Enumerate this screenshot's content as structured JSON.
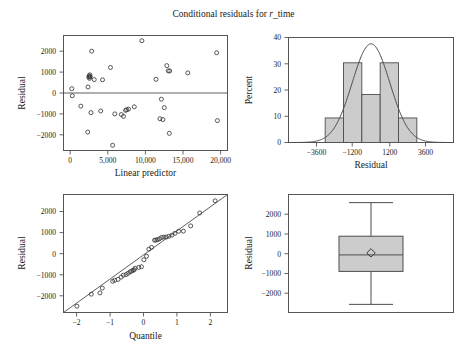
{
  "figure": {
    "title_prefix": "Conditional residuals for ",
    "title_italic": "r",
    "title_suffix": "_time",
    "title_full": "Conditional residuals for r_time",
    "width": 467,
    "height": 357,
    "background": "#ffffff",
    "marker_color": "#3a3a3a",
    "bar_fill": "#cccccc",
    "line_color": "#4d4d4d"
  },
  "chart_data": [
    {
      "type": "scatter",
      "panel": "top-left",
      "title": "",
      "xlabel": "Linear predictor",
      "ylabel": "Residual",
      "xlim": [
        -900,
        21800
      ],
      "ylim": [
        -2750,
        2750
      ],
      "xticks": [
        0,
        5000,
        10000,
        15000,
        20000
      ],
      "xticklabels": [
        "0",
        "5,000",
        "10,000",
        "15,000",
        "20,000"
      ],
      "yticks": [
        -2000,
        -1000,
        0,
        1000,
        2000
      ],
      "yticklabels": [
        "−2000",
        "−1000",
        "0",
        "1000",
        "2000"
      ],
      "grid": false,
      "reference_line": {
        "type": "horizontal",
        "y": 0
      },
      "x": [
        250,
        320,
        1500,
        2450,
        2500,
        2600,
        2650,
        2700,
        2720,
        2750,
        2800,
        2900,
        3000,
        3350,
        4250,
        4500,
        5600,
        5900,
        6200,
        7100,
        7400,
        7700,
        7850,
        8100,
        8900,
        9950,
        11900,
        12450,
        12650,
        12850,
        13050,
        13400,
        13600,
        13750,
        13800,
        16300,
        20300,
        20400
      ],
      "y": [
        205,
        -130,
        -630,
        -1870,
        290,
        760,
        820,
        700,
        780,
        870,
        780,
        -940,
        2000,
        640,
        -860,
        630,
        1220,
        -2500,
        -1000,
        -1030,
        -1120,
        -830,
        -800,
        -770,
        -660,
        2500,
        655,
        -1230,
        -295,
        -1270,
        -700,
        1310,
        1060,
        -1930,
        1055,
        960,
        1925,
        -1320
      ]
    },
    {
      "type": "bar",
      "panel": "top-right",
      "title": "",
      "xlabel": "Residual",
      "ylabel": "Percent",
      "xlim": [
        -5400,
        5400
      ],
      "ylim": [
        0,
        41.5
      ],
      "xticks": [
        -3600,
        -1200,
        1200,
        3600
      ],
      "xticklabels": [
        "−3600",
        "−1200",
        "1200",
        "3600"
      ],
      "yticks": [
        0,
        10,
        20,
        30,
        40
      ],
      "yticklabels": [
        "0",
        "10",
        "20",
        "30",
        "40"
      ],
      "grid": false,
      "bin_edges": [
        -3000,
        -1800,
        -600,
        600,
        1800,
        3000
      ],
      "bin_centers": [
        -2400,
        -1200,
        0,
        1200,
        2400
      ],
      "values": [
        9.7,
        31.5,
        19.0,
        31.5,
        9.7
      ],
      "overlay": {
        "kind": "normal-density-curve",
        "mean": 0,
        "sd": 1230,
        "peak_percent": 39
      }
    },
    {
      "type": "scatter",
      "panel": "bottom-left",
      "subtype": "qq-plot",
      "title": "",
      "xlabel": "Quantile",
      "ylabel": "Residual",
      "xlim": [
        -2.45,
        2.45
      ],
      "ylim": [
        -2800,
        2800
      ],
      "xticks": [
        -2,
        -1,
        0,
        1,
        2
      ],
      "xticklabels": [
        "−2",
        "−1",
        "0",
        "1",
        "2"
      ],
      "yticks": [
        -2000,
        -1000,
        0,
        1000,
        2000
      ],
      "yticklabels": [
        "−2000",
        "−1000",
        "0",
        "1000",
        "2000"
      ],
      "grid": false,
      "reference_line": {
        "type": "diagonal",
        "slope": 1230,
        "intercept": -30
      },
      "x": [
        -2.05,
        -1.62,
        -1.36,
        -1.29,
        -0.98,
        -0.92,
        -0.82,
        -0.73,
        -0.66,
        -0.58,
        -0.52,
        -0.46,
        -0.41,
        -0.37,
        -0.34,
        -0.31,
        -0.2,
        -0.12,
        -0.05,
        0.03,
        0.1,
        0.18,
        0.27,
        0.31,
        0.36,
        0.42,
        0.48,
        0.55,
        0.62,
        0.7,
        0.79,
        0.88,
        0.99,
        1.13,
        1.35,
        1.62,
        2.08
      ],
      "y": [
        -2500,
        -1930,
        -1870,
        -1640,
        -1320,
        -1270,
        -1230,
        -1120,
        -1030,
        -1000,
        -940,
        -870,
        -830,
        -800,
        -770,
        -700,
        -660,
        -630,
        -295,
        -130,
        205,
        290,
        630,
        640,
        655,
        700,
        760,
        780,
        780,
        820,
        870,
        960,
        1055,
        1060,
        1310,
        1925,
        2500
      ]
    },
    {
      "type": "box",
      "panel": "bottom-right",
      "title": "",
      "xlabel": "",
      "ylabel": "Residual",
      "ylim": [
        -2900,
        2900
      ],
      "yticks": [
        -2000,
        -1000,
        0,
        1000,
        2000
      ],
      "yticklabels": [
        "−2000",
        "−1000",
        "0",
        "1000",
        "2000"
      ],
      "grid": false,
      "stats": {
        "whisker_low": -2500,
        "q1": -880,
        "median": -70,
        "q3": 850,
        "whisker_high": 2500,
        "mean": 30,
        "mean_marker": "diamond"
      }
    }
  ]
}
